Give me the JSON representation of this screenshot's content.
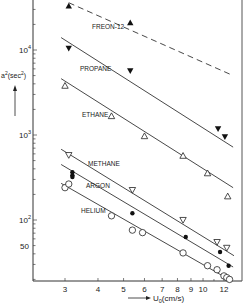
{
  "chart_data": {
    "type": "scatter",
    "title": "",
    "xlabel": "U0 (cm/s)",
    "xlabel_main": "U",
    "xlabel_sub": "0",
    "xlabel_unit": "(cm/s)",
    "ylabel": "a²(sec²)",
    "xscale": "log",
    "yscale": "log",
    "xlim": [
      2.4,
      13.5
    ],
    "ylim": [
      18,
      40000
    ],
    "x_ticks": [
      3,
      4,
      5,
      6,
      7,
      8,
      9,
      10,
      12
    ],
    "x_tick_labels": [
      "3",
      "4",
      "5",
      "6",
      "7",
      "8",
      "9",
      "10",
      "12"
    ],
    "y_ticks": [
      50,
      100,
      1000,
      10000
    ],
    "y_tick_labels": [
      "50",
      "10²",
      "10³",
      "10⁴"
    ],
    "grid": false,
    "legend": "inline labels",
    "series": [
      {
        "name": "FREON-12",
        "marker": "filled-triangle-up",
        "line_style": "dashed",
        "line": [
          [
            3.1,
            36000
          ],
          [
            13.0,
            5000
          ]
        ],
        "points": [
          [
            3.1,
            33000
          ],
          [
            5.3,
            21000
          ]
        ]
      },
      {
        "name": "PROPANE",
        "marker": "filled-triangle-down",
        "line_style": "solid",
        "line": [
          [
            2.9,
            14000
          ],
          [
            13.0,
            720
          ]
        ],
        "points": [
          [
            3.1,
            10500
          ],
          [
            5.3,
            5700
          ],
          [
            11.4,
            1180
          ],
          [
            12.1,
            950
          ]
        ]
      },
      {
        "name": "ETHANE",
        "marker": "open-triangle-up",
        "line_style": "solid",
        "line": [
          [
            2.9,
            4600
          ],
          [
            13.0,
            240
          ]
        ],
        "points": [
          [
            3.0,
            3800
          ],
          [
            4.5,
            1670
          ],
          [
            6.0,
            970
          ],
          [
            8.4,
            570
          ],
          [
            10.4,
            355
          ],
          [
            12.4,
            190
          ]
        ]
      },
      {
        "name": "METHANE",
        "marker": "open-triangle-down",
        "line_style": "solid",
        "line": [
          [
            2.9,
            680
          ],
          [
            13.1,
            38
          ]
        ],
        "points": [
          [
            3.1,
            580
          ],
          [
            5.4,
            225
          ],
          [
            8.4,
            100
          ],
          [
            11.3,
            55
          ],
          [
            12.3,
            47
          ]
        ]
      },
      {
        "name": "ARGON",
        "marker": "filled-circle",
        "line_style": "solid",
        "line": [
          [
            2.9,
            450
          ],
          [
            13.0,
            28
          ]
        ],
        "points": [
          [
            3.2,
            365
          ],
          [
            3.2,
            335
          ],
          [
            3.2,
            320
          ],
          [
            5.4,
            120
          ],
          [
            8.6,
            63
          ],
          [
            11.6,
            42
          ],
          [
            12.5,
            29
          ]
        ]
      },
      {
        "name": "HELIUM",
        "marker": "open-circle",
        "line_style": "solid",
        "line": [
          [
            2.9,
            270
          ],
          [
            12.9,
            19
          ]
        ],
        "points": [
          [
            3.0,
            240
          ],
          [
            3.1,
            265
          ],
          [
            4.5,
            112
          ],
          [
            5.4,
            76
          ],
          [
            5.9,
            71
          ],
          [
            8.4,
            41
          ],
          [
            10.4,
            29
          ],
          [
            11.3,
            26
          ],
          [
            12.0,
            22
          ],
          [
            12.3,
            21
          ],
          [
            12.6,
            20
          ]
        ]
      }
    ],
    "annotations": [
      "FREON-12",
      "PROPANE",
      "ETHANE",
      "METHANE",
      "ARGON",
      "HELIUM"
    ]
  },
  "labels": {
    "freon": "FREON-12",
    "propane": "PROPANE",
    "ethane": "ETHANE",
    "methane": "METHANE",
    "argon": "ARGON",
    "helium": "HELIUM"
  }
}
